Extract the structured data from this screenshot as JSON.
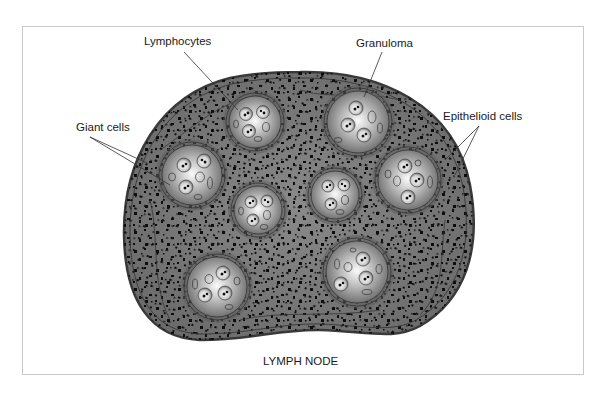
{
  "figure": {
    "title": "LYMPH NODE",
    "labels": {
      "lymphocytes": "Lymphocytes",
      "granuloma": "Granuloma",
      "giant_cells": "Giant cells",
      "epithelioid_cells": "Epithelioid cells"
    },
    "colors": {
      "node_fill": "#6e6e6e",
      "node_border": "#3a3a3a",
      "granuloma_highlight": "#f2f2f2",
      "granuloma_shadow": "#7a7a7a",
      "dots": "#0d0d0d",
      "frame": "#c9c9c9"
    },
    "granulomas": [
      {
        "id": "g1",
        "cx": 255,
        "cy": 122,
        "r": 28
      },
      {
        "id": "g2",
        "cx": 358,
        "cy": 122,
        "r": 33
      },
      {
        "id": "g3",
        "cx": 192,
        "cy": 175,
        "r": 32
      },
      {
        "id": "g4",
        "cx": 408,
        "cy": 180,
        "r": 32
      },
      {
        "id": "g5",
        "cx": 335,
        "cy": 195,
        "r": 26
      },
      {
        "id": "g6",
        "cx": 258,
        "cy": 210,
        "r": 26
      },
      {
        "id": "g7",
        "cx": 217,
        "cy": 287,
        "r": 32
      },
      {
        "id": "g8",
        "cx": 357,
        "cy": 272,
        "r": 33
      }
    ]
  }
}
